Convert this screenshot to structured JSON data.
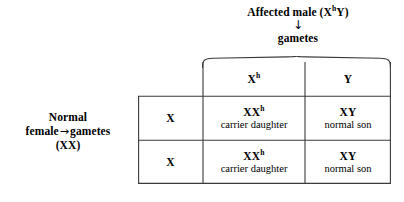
{
  "diagram": {
    "paternal": {
      "title_prefix": "Affected male (X",
      "title_sup": "h",
      "title_suffix": "Y)",
      "arrow": "↓",
      "gametes_label": "gametes"
    },
    "maternal": {
      "line1": "Normal",
      "line2_prefix": "female",
      "arrow": "→",
      "line2_suffix": "gametes",
      "line3": "(XX)"
    },
    "grid": {
      "column_headers": [
        {
          "base": "X",
          "sup": "h"
        },
        {
          "base": "Y",
          "sup": ""
        }
      ],
      "row_headers": [
        {
          "base": "X",
          "sup": ""
        },
        {
          "base": "X",
          "sup": ""
        }
      ],
      "cells": [
        [
          {
            "genotype_base": "XX",
            "genotype_sup": "h",
            "phenotype": "carrier daughter"
          },
          {
            "genotype_base": "XY",
            "genotype_sup": "",
            "phenotype": "normal son"
          }
        ],
        [
          {
            "genotype_base": "XX",
            "genotype_sup": "h",
            "phenotype": "carrier daughter"
          },
          {
            "genotype_base": "XY",
            "genotype_sup": "",
            "phenotype": "normal son"
          }
        ]
      ]
    },
    "colors": {
      "background": "#ffffff",
      "ink": "#000000",
      "rule": "#3a3a3a"
    }
  }
}
